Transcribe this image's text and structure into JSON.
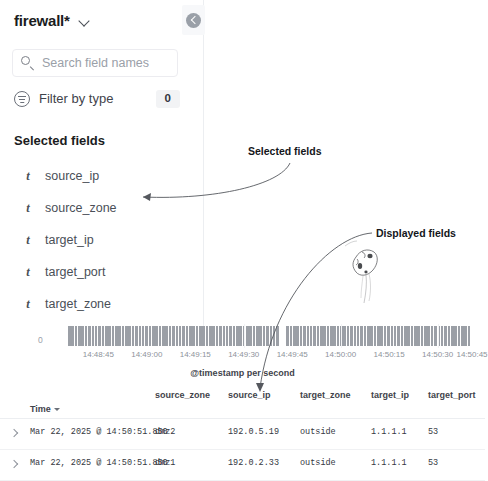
{
  "sidebar": {
    "index_pattern": "firewall*",
    "index_pattern_caret_icon": "chevron-down-icon",
    "search": {
      "placeholder": "Search field names",
      "value": "",
      "icon": "search-icon"
    },
    "filter_by_type": {
      "label": "Filter by type",
      "count": "0",
      "icon": "filter-icon"
    },
    "selected_fields_heading": "Selected fields",
    "fields": [
      {
        "name": "source_ip",
        "type_icon": "t"
      },
      {
        "name": "source_zone",
        "type_icon": "t"
      },
      {
        "name": "target_ip",
        "type_icon": "t"
      },
      {
        "name": "target_port",
        "type_icon": "t"
      },
      {
        "name": "target_zone",
        "type_icon": "t"
      }
    ],
    "collapse_button_icon": "chevron-left-circle-icon"
  },
  "annotations": [
    {
      "text": "Selected fields"
    },
    {
      "text": "Displayed fields"
    }
  ],
  "chart_data": {
    "type": "bar",
    "title": "",
    "xlabel": "@timestamp per second",
    "ylabel": "",
    "ylim": [
      0,
      1
    ],
    "y_tick_labels": [
      "0"
    ],
    "grid": false,
    "tick_labels": [
      "14:48:45",
      "14:49:00",
      "14:49:15",
      "14:49:30",
      "14:49:45",
      "14:50:00",
      "14:50:15",
      "14:50:30",
      "14:50:45"
    ],
    "tick_positions_pct": [
      7.5,
      19.5,
      31.5,
      43.5,
      55.5,
      67.5,
      79.5,
      91.5,
      100
    ],
    "bar_color": "#9b9fa6",
    "bar_count": 120,
    "empty_bar_indices": [
      63,
      64
    ],
    "values_note": "uniform bars of equal height across the range, with a narrow gap near 14:49:45",
    "values": [
      1,
      1,
      1,
      1,
      1,
      1,
      1,
      1,
      1,
      1,
      1,
      1,
      1,
      1,
      1,
      1,
      1,
      1,
      1,
      1,
      1,
      1,
      1,
      1,
      1,
      1,
      1,
      1,
      1,
      1,
      1,
      1,
      1,
      1,
      1,
      1,
      1,
      1,
      1,
      1,
      1,
      1,
      1,
      1,
      1,
      1,
      1,
      1,
      1,
      1,
      1,
      1,
      1,
      1,
      1,
      1,
      1,
      1,
      1,
      1,
      1,
      1,
      1,
      0,
      0,
      1,
      1,
      1,
      1,
      1,
      1,
      1,
      1,
      1,
      1,
      1,
      1,
      1,
      1,
      1,
      1,
      1,
      1,
      1,
      1,
      1,
      1,
      1,
      1,
      1,
      1,
      1,
      1,
      1,
      1,
      1,
      1,
      1,
      1,
      1,
      1,
      1,
      1,
      1,
      1,
      1,
      1,
      1,
      1,
      1,
      1,
      1,
      1,
      1,
      1,
      1,
      1,
      1,
      1,
      1
    ]
  },
  "doc_table": {
    "time_column_label": "Time",
    "time_sort_icon": "sort-descending-caret-icon",
    "columns": [
      {
        "key": "source_zone",
        "label": "source_zone",
        "x": 155
      },
      {
        "key": "source_ip",
        "label": "source_ip",
        "x": 228
      },
      {
        "key": "target_zone",
        "label": "target_zone",
        "x": 300
      },
      {
        "key": "target_ip",
        "label": "target_ip",
        "x": 371
      },
      {
        "key": "target_port",
        "label": "target_port",
        "x": 428
      }
    ],
    "rows": [
      {
        "expand_icon": "chevron-right-icon",
        "time": "Mar 22, 2025 @ 14:50:51.850",
        "source_zone": "dmz2",
        "source_ip": "192.0.5.19",
        "target_zone": "outside",
        "target_ip": "1.1.1.1",
        "target_port": "53"
      },
      {
        "expand_icon": "chevron-right-icon",
        "time": "Mar 22, 2025 @ 14:50:51.850",
        "source_zone": "dmz1",
        "source_ip": "192.0.2.33",
        "target_zone": "outside",
        "target_ip": "1.1.1.1",
        "target_port": "53"
      }
    ]
  },
  "colors": {
    "bar": "#9b9fa6",
    "text": "#343741",
    "muted": "#9aa0a8",
    "border": "#eceef1"
  }
}
